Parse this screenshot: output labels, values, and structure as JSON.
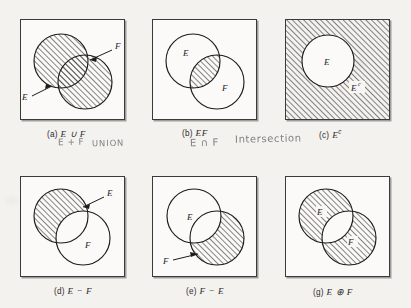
{
  "figure": {
    "hatch_color": "#3c3c3c",
    "frame_color": "#3a3a3a",
    "handwriting_color": "#6f6f72",
    "page_background": "#f4f2ef"
  },
  "panels": [
    {
      "id": "a",
      "caption_label": "(a)",
      "caption_expr": "E ∪ F",
      "set_labels": [
        "E",
        "F"
      ],
      "shaded_description": "both circles fully shaded",
      "annotation_line1": "E + F",
      "annotation_line2": "UNION"
    },
    {
      "id": "b",
      "caption_label": "(b)",
      "caption_expr": "EF",
      "set_labels": [
        "E",
        "F"
      ],
      "shaded_description": "overlap region shaded",
      "annotation_line1": "E ∩ F",
      "annotation_line2": "Intersection"
    },
    {
      "id": "c",
      "caption_label": "(c)",
      "caption_expr": "E",
      "caption_sup": "c",
      "set_labels": [
        "E",
        "E"
      ],
      "set_label_sup": "c",
      "shaded_description": "square shaded, circle E unshaded",
      "annotation_line1": "",
      "annotation_line2": ""
    },
    {
      "id": "d",
      "caption_label": "(d)",
      "caption_expr": "E − F",
      "set_labels": [
        "E",
        "F"
      ],
      "shaded_description": "E minus overlap shaded",
      "annotation_line1": "",
      "annotation_line2": ""
    },
    {
      "id": "e",
      "caption_label": "(e)",
      "caption_expr": "F − E",
      "set_labels": [
        "E",
        "F"
      ],
      "shaded_description": "F minus overlap shaded",
      "annotation_line1": "",
      "annotation_line2": ""
    },
    {
      "id": "g",
      "caption_label": "(g)",
      "caption_expr": "E ⊕ F",
      "set_labels": [
        "E",
        "F"
      ],
      "shaded_description": "both circles shaded except overlap",
      "annotation_line1": "",
      "annotation_line2": ""
    }
  ]
}
